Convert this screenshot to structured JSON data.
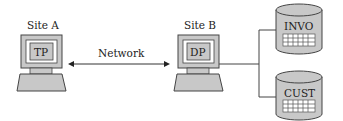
{
  "sites": [
    {
      "label": "Site A",
      "terminal_label": "TP"
    },
    {
      "label": "Site B",
      "terminal_label": "DP"
    }
  ],
  "network": {
    "label": "Network"
  },
  "databases": [
    {
      "label": "INVO"
    },
    {
      "label": "CUST"
    }
  ],
  "colors": {
    "fill": "#c8c8c8",
    "stroke": "#444444",
    "screen": "#ffffff"
  }
}
